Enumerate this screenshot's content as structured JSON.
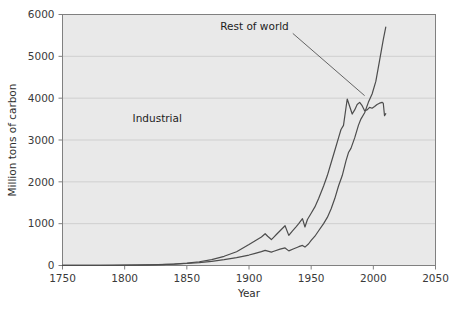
{
  "chart_data": {
    "type": "line",
    "title": "",
    "xlabel": "Year",
    "ylabel": "Million tons of carbon",
    "xlim": [
      1750,
      2050
    ],
    "ylim": [
      0,
      6000
    ],
    "xticks": [
      1750,
      1800,
      1850,
      1900,
      1950,
      2000,
      2050
    ],
    "xtick_labels": [
      "1750",
      "1800",
      "1850",
      "1900",
      "1950",
      "2000",
      "2050"
    ],
    "yticks": [
      0,
      1000,
      2000,
      3000,
      4000,
      5000,
      6000
    ],
    "ytick_labels": [
      "0",
      "1000",
      "2000",
      "3000",
      "4000",
      "5000",
      "6000"
    ],
    "grid": "horizontal",
    "legend_position": "inline-annotations",
    "plot_background": "#e9e9e9",
    "line_color": "#4d4d4d",
    "grid_color": "#cfcfcf",
    "axis_color": "#808080",
    "annotations": [
      {
        "name": "rest-of-world",
        "label": "Rest of world",
        "x_text": 1932,
        "y_text": 5620,
        "leader_to_x": 1993,
        "leader_to_y": 4060
      },
      {
        "name": "industrial",
        "label": "Industrial",
        "x_text": 1846,
        "y_text": 3420,
        "leader_to_x": null,
        "leader_to_y": null
      }
    ],
    "series": [
      {
        "name": "Rest of world",
        "description": "Total global emissions including rest of world; rises steeply after 1950 to about 5700 by 2010",
        "x": [
          1750,
          1770,
          1790,
          1810,
          1830,
          1850,
          1860,
          1870,
          1880,
          1890,
          1900,
          1905,
          1910,
          1913,
          1918,
          1920,
          1925,
          1929,
          1932,
          1936,
          1940,
          1943,
          1945,
          1948,
          1950,
          1953,
          1956,
          1960,
          1963,
          1966,
          1969,
          1972,
          1975,
          1978,
          1980,
          1982,
          1985,
          1988,
          1990,
          1993,
          1996,
          1999,
          2002,
          2005,
          2008,
          2010
        ],
        "y": [
          3,
          4,
          6,
          11,
          22,
          48,
          70,
          100,
          140,
          190,
          250,
          290,
          330,
          360,
          320,
          340,
          390,
          420,
          350,
          400,
          450,
          480,
          440,
          520,
          600,
          700,
          830,
          1000,
          1150,
          1350,
          1600,
          1900,
          2150,
          2500,
          2700,
          2800,
          3050,
          3350,
          3500,
          3650,
          3900,
          4100,
          4400,
          4900,
          5400,
          5700
        ]
      },
      {
        "name": "Industrial",
        "description": "Industrialized-nations emissions; peaks near 4000 around 1979, dips, recovers to about 3900 by 2008, then falls to about 3600",
        "x": [
          1750,
          1780,
          1800,
          1820,
          1840,
          1850,
          1860,
          1870,
          1880,
          1890,
          1900,
          1905,
          1910,
          1913,
          1915,
          1918,
          1920,
          1922,
          1925,
          1929,
          1932,
          1935,
          1938,
          1940,
          1943,
          1945,
          1947,
          1950,
          1953,
          1956,
          1960,
          1963,
          1966,
          1969,
          1972,
          1974,
          1976,
          1979,
          1981,
          1983,
          1985,
          1987,
          1989,
          1991,
          1993,
          1995,
          1997,
          1999,
          2001,
          2003,
          2005,
          2007,
          2008,
          2009,
          2010
        ],
        "y": [
          3,
          4,
          8,
          16,
          35,
          55,
          90,
          140,
          220,
          330,
          500,
          590,
          680,
          760,
          700,
          620,
          680,
          740,
          830,
          950,
          720,
          830,
          930,
          1000,
          1120,
          920,
          1100,
          1250,
          1400,
          1600,
          1900,
          2150,
          2450,
          2750,
          3050,
          3250,
          3350,
          3980,
          3800,
          3620,
          3720,
          3850,
          3900,
          3820,
          3700,
          3720,
          3780,
          3760,
          3800,
          3850,
          3880,
          3900,
          3880,
          3580,
          3630
        ]
      }
    ]
  }
}
